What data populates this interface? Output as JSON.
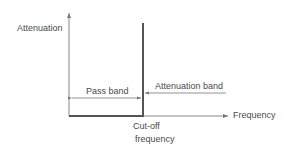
{
  "diagram": {
    "y_axis_label": "Attenuation",
    "x_axis_label": "Frequency",
    "pass_band_label": "Pass band",
    "attenuation_band_label": "Attenuation band",
    "cutoff_label_line1": "Cut-off",
    "cutoff_label_line2": "frequency",
    "colors": {
      "axis": "#8a8a8a",
      "response": "#555555",
      "text": "#4a4a4a"
    }
  }
}
